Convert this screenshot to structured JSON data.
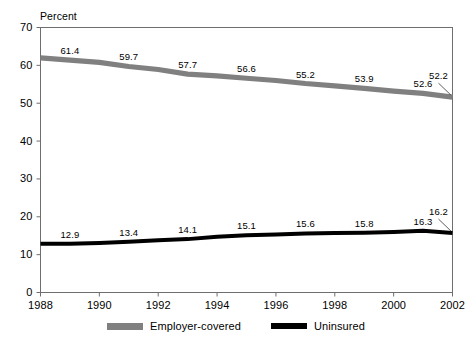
{
  "chart_data": {
    "type": "line",
    "title": "",
    "xlabel": "",
    "ylabel": "Percent",
    "x": [
      1988,
      1989,
      1990,
      1991,
      1992,
      1993,
      1994,
      1995,
      1996,
      1997,
      1998,
      1999,
      2000,
      2001,
      2002
    ],
    "xlim": [
      1988,
      2002
    ],
    "ylim": [
      0,
      70
    ],
    "ytick_labels": [
      "0",
      "10",
      "20",
      "30",
      "40",
      "50",
      "60",
      "70"
    ],
    "ytick_values": [
      0,
      10,
      20,
      30,
      40,
      50,
      60,
      70
    ],
    "xtick_labels": [
      "1988",
      "1990",
      "1992",
      "1994",
      "1996",
      "1998",
      "2000",
      "2002"
    ],
    "xtick_values": [
      1988,
      1990,
      1992,
      1994,
      1996,
      1998,
      2000,
      2002
    ],
    "grid": false,
    "legend_position": "bottom",
    "series": [
      {
        "name": "Employer-covered",
        "color": "#808080",
        "values": [
          62.0,
          61.4,
          60.8,
          59.7,
          58.9,
          57.7,
          57.2,
          56.6,
          56.0,
          55.2,
          54.6,
          53.9,
          53.2,
          52.6,
          51.6
        ],
        "labels": [
          {
            "text": "61.4",
            "x": 1989,
            "y": 61.4
          },
          {
            "text": "59.7",
            "x": 1991,
            "y": 59.7
          },
          {
            "text": "57.7",
            "x": 1993,
            "y": 57.7
          },
          {
            "text": "56.6",
            "x": 1995,
            "y": 56.6
          },
          {
            "text": "55.2",
            "x": 1997,
            "y": 55.2
          },
          {
            "text": "53.9",
            "x": 1999,
            "y": 53.9
          },
          {
            "text": "52.6",
            "x": 2001,
            "y": 52.6
          },
          {
            "text": "52.2",
            "x": 2002,
            "y": 51.6
          }
        ]
      },
      {
        "name": "Uninsured",
        "color": "#000000",
        "values": [
          12.9,
          12.9,
          13.1,
          13.4,
          13.8,
          14.1,
          14.7,
          15.1,
          15.3,
          15.6,
          15.7,
          15.8,
          16.0,
          16.3,
          15.7
        ],
        "labels": [
          {
            "text": "12.9",
            "x": 1989,
            "y": 12.9
          },
          {
            "text": "13.4",
            "x": 1991,
            "y": 13.4
          },
          {
            "text": "14.1",
            "x": 1993,
            "y": 14.1
          },
          {
            "text": "15.1",
            "x": 1995,
            "y": 15.1
          },
          {
            "text": "15.6",
            "x": 1997,
            "y": 15.6
          },
          {
            "text": "15.8",
            "x": 1999,
            "y": 15.8
          },
          {
            "text": "16.3",
            "x": 2001,
            "y": 16.3
          },
          {
            "text": "16.2",
            "x": 2002,
            "y": 15.7
          }
        ]
      }
    ]
  },
  "axis": {
    "unit_label": "Percent"
  },
  "legend": {
    "items": [
      {
        "label": "Employer-covered",
        "color": "#808080"
      },
      {
        "label": "Uninsured",
        "color": "#000000"
      }
    ]
  },
  "colors": {
    "employer_covered": "#808080",
    "uninsured": "#000000",
    "axis": "#6e6e6e",
    "background": "#ffffff"
  }
}
